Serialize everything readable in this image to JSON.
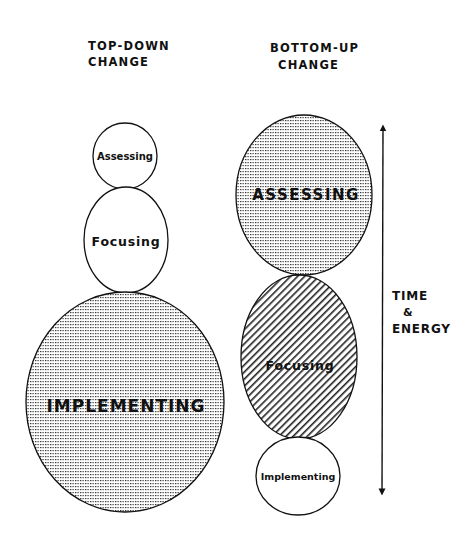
{
  "headers": {
    "top_down": {
      "line1": "TOP-DOWN",
      "line2": "CHANGE"
    },
    "bottom_up": {
      "line1": "BOTTOM-UP",
      "line2": "CHANGE"
    }
  },
  "top_down": {
    "assessing": {
      "label": "Assessing",
      "fill": "none"
    },
    "focusing": {
      "label": "Focusing",
      "fill": "none"
    },
    "implementing": {
      "label": "IMPLEMENTING",
      "fill": "dots"
    }
  },
  "bottom_up": {
    "assessing": {
      "label": "ASSESSING",
      "fill": "dots"
    },
    "focusing": {
      "label": "Focusing",
      "fill": "hatch"
    },
    "implementing": {
      "label": "Implementing",
      "fill": "none"
    }
  },
  "axis": {
    "line1": "TIME",
    "line2": "&",
    "line3": "ENERGY",
    "direction": "bidirectional-vertical"
  },
  "colors": {
    "ink": "#111111",
    "background": "#ffffff"
  }
}
